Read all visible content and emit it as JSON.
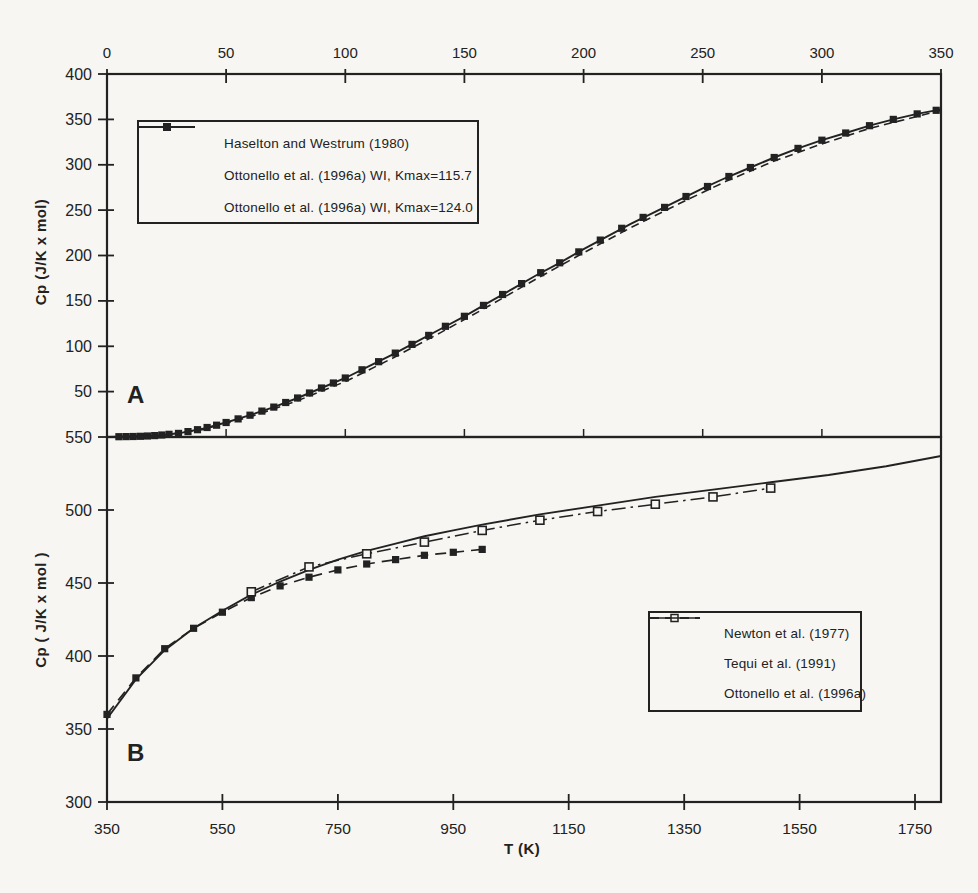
{
  "figure": {
    "background": "#f7f6f2",
    "ink": "#222222",
    "panel_a_label": "A",
    "panel_b_label": "B"
  },
  "chart_data": [
    {
      "panel": "A",
      "type": "line",
      "title": "",
      "x_axis": {
        "position": "top",
        "label": "",
        "ticks": [
          0,
          50,
          100,
          150,
          200,
          250,
          300,
          350
        ],
        "range": [
          0,
          350
        ]
      },
      "y_axis": {
        "label": "Cp (J/K x mol)",
        "ticks": [
          400,
          350,
          300,
          250,
          200,
          150,
          100,
          50
        ],
        "range": [
          0,
          400
        ]
      },
      "legend_position": "upper-left",
      "series": [
        {
          "name": "Haselton and Westrum (1980)",
          "line": "none",
          "marker": "filled-square",
          "x": [
            5,
            8,
            11,
            14,
            17,
            20,
            23,
            26,
            30,
            34,
            38,
            42,
            46,
            50,
            55,
            60,
            65,
            70,
            75,
            80,
            85,
            90,
            95,
            100,
            107,
            114,
            121,
            128,
            135,
            142,
            150,
            158,
            166,
            174,
            182,
            190,
            198,
            207,
            216,
            225,
            234,
            243,
            252,
            261,
            270,
            280,
            290,
            300,
            310,
            320,
            330,
            340,
            348
          ],
          "y": [
            0.3,
            0.4,
            0.6,
            0.8,
            1.1,
            1.5,
            2.2,
            3,
            4,
            6,
            8,
            10.5,
            13,
            16,
            20,
            24,
            28.5,
            33,
            38,
            43,
            48.5,
            54,
            59.5,
            65,
            74,
            83,
            92.5,
            102,
            112,
            122,
            133,
            145,
            157,
            169,
            181,
            192,
            204,
            217,
            230,
            242,
            253,
            265,
            276,
            287,
            297,
            308,
            318,
            327,
            335,
            343,
            350,
            356,
            360
          ]
        },
        {
          "name": "Ottonello et al. (1996a) WI, Kmax=115.7",
          "line": "dashed",
          "marker": "none",
          "x": [
            0,
            20,
            40,
            60,
            80,
            100,
            120,
            140,
            160,
            180,
            200,
            220,
            240,
            260,
            280,
            300,
            320,
            335,
            350
          ],
          "y": [
            0,
            1,
            8,
            22,
            40,
            61,
            87,
            115,
            144,
            174,
            203,
            231,
            257,
            282,
            304,
            323,
            340,
            350,
            360
          ]
        },
        {
          "name": "Ottonello et al. (1996a) WI, Kmax=124.0",
          "line": "solid",
          "marker": "none",
          "x": [
            0,
            10,
            20,
            30,
            40,
            50,
            60,
            70,
            80,
            90,
            100,
            110,
            120,
            130,
            140,
            150,
            160,
            170,
            180,
            190,
            200,
            210,
            220,
            230,
            240,
            250,
            260,
            270,
            280,
            290,
            300,
            310,
            320,
            330,
            340,
            350
          ],
          "y": [
            0,
            0.5,
            1.5,
            4,
            9,
            16,
            24,
            33,
            43,
            54,
            65,
            78,
            91,
            105,
            119,
            133,
            148,
            163,
            178,
            192,
            207,
            221,
            235,
            248,
            261,
            274,
            286,
            297,
            308,
            318,
            327,
            335,
            343,
            350,
            356,
            361
          ]
        }
      ]
    },
    {
      "panel": "B",
      "type": "line",
      "title": "",
      "x_axis": {
        "position": "bottom",
        "label": "T (K)",
        "ticks": [
          350,
          550,
          750,
          950,
          1150,
          1350,
          1550,
          1750
        ],
        "range": [
          350,
          1795
        ]
      },
      "y_axis": {
        "label": "Cp ( J/K x mol )",
        "ticks": [
          550,
          500,
          450,
          400,
          350,
          300
        ],
        "range": [
          300,
          550
        ]
      },
      "legend_position": "lower-right",
      "series": [
        {
          "name": "Newton et al. (1977)",
          "line": "dash",
          "marker": "filled-square",
          "x": [
            350,
            400,
            450,
            500,
            550,
            600,
            650,
            700,
            750,
            800,
            850,
            900,
            950,
            1000
          ],
          "y": [
            360,
            385,
            405,
            419,
            430,
            440,
            448,
            454,
            459,
            463,
            466,
            469,
            471,
            473
          ]
        },
        {
          "name": "Tequi et al. (1991)",
          "line": "dashdot",
          "marker": "open-square",
          "x": [
            600,
            700,
            800,
            900,
            1000,
            1100,
            1200,
            1300,
            1400,
            1500
          ],
          "y": [
            444,
            461,
            470,
            478,
            486,
            493,
            499,
            504,
            509,
            515
          ]
        },
        {
          "name": "Ottonello et al. (1996a)",
          "line": "solid",
          "marker": "none",
          "x": [
            350,
            400,
            450,
            500,
            550,
            600,
            650,
            700,
            750,
            800,
            850,
            900,
            950,
            1000,
            1100,
            1200,
            1300,
            1400,
            1500,
            1600,
            1700,
            1795
          ],
          "y": [
            357,
            384,
            404,
            419,
            431,
            442,
            451,
            459,
            466,
            472,
            477,
            482,
            486,
            490,
            497,
            503,
            509,
            514,
            519,
            524,
            530,
            537
          ]
        }
      ]
    }
  ]
}
